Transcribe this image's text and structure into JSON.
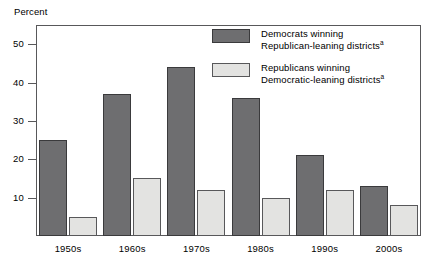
{
  "chart_data": {
    "type": "bar",
    "title": "",
    "xlabel": "",
    "ylabel": "Percent",
    "ylim": [
      0,
      55
    ],
    "yticks": [
      10,
      20,
      30,
      40,
      50
    ],
    "grid": false,
    "legend_position": "top-right",
    "categories": [
      "1950s",
      "1960s",
      "1970s",
      "1980s",
      "1990s",
      "2000s"
    ],
    "series": [
      {
        "name": "Democrats winning Republican-leaning districts",
        "footnote_marker": "a",
        "color": "#6e6e70",
        "values": [
          25,
          37,
          44,
          36,
          21,
          13
        ]
      },
      {
        "name": "Republicans winning Democratic-leaning districts",
        "footnote_marker": "a",
        "color": "#e3e3e1",
        "values": [
          5,
          15,
          12,
          10,
          12,
          8
        ]
      }
    ]
  },
  "axis": {
    "y_title": "Percent",
    "y_tick_labels": [
      "50",
      "40",
      "30",
      "20",
      "10"
    ],
    "x_tick_labels": [
      "1950s",
      "1960s",
      "1970s",
      "1980s",
      "1990s",
      "2000s"
    ]
  },
  "legend": {
    "items": [
      {
        "line1": "Democrats winning",
        "line2": "Republican-leaning districts",
        "marker": "a",
        "swatch": "dark-gray-swatch"
      },
      {
        "line1": "Republicans winning",
        "line2": "Democratic-leaning districts",
        "marker": "a",
        "swatch": "light-gray-swatch"
      }
    ]
  },
  "colors": {
    "democrat_bar": "#6e6e70",
    "republican_bar": "#e3e3e1",
    "frame": "#58585a",
    "background": "#ffffff"
  }
}
